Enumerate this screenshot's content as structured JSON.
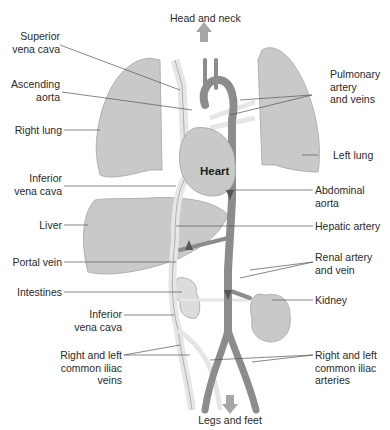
{
  "diagram": {
    "type": "circulatory-system-overview",
    "colors": {
      "organ_fill": "#c9c9c9",
      "organ_stroke": "#9a9a9a",
      "artery": "#8c8c8c",
      "vein": "#e6e6e6",
      "vein_stroke": "#b0b0b0",
      "leader_line": "#555555",
      "direction_arrow": "#a6a6a6"
    },
    "direction_labels": {
      "top": "Head and neck",
      "bottom": "Legs and feet"
    },
    "organ_labels": {
      "heart": "Heart"
    },
    "left_labels": [
      {
        "id": "superior-vena-cava",
        "text": "Superior\nvena cava"
      },
      {
        "id": "ascending-aorta",
        "text": "Ascending\naorta"
      },
      {
        "id": "right-lung",
        "text": "Right lung"
      },
      {
        "id": "inferior-vena-cava-upper",
        "text": "Inferior\nvena cava"
      },
      {
        "id": "liver",
        "text": "Liver"
      },
      {
        "id": "portal-vein",
        "text": "Portal vein"
      },
      {
        "id": "intestines",
        "text": "Intestines"
      },
      {
        "id": "inferior-vena-cava-lower",
        "text": "Inferior\nvena cava"
      },
      {
        "id": "common-iliac-veins",
        "text": "Right and left\ncommon iliac\nveins"
      }
    ],
    "right_labels": [
      {
        "id": "pulmonary-artery-veins",
        "text": "Pulmonary\nartery\nand veins"
      },
      {
        "id": "left-lung",
        "text": "Left lung"
      },
      {
        "id": "abdominal-aorta",
        "text": "Abdominal\naorta"
      },
      {
        "id": "hepatic-artery",
        "text": "Hepatic artery"
      },
      {
        "id": "renal-artery-vein",
        "text": "Renal artery\nand vein"
      },
      {
        "id": "kidney",
        "text": "Kidney"
      },
      {
        "id": "common-iliac-arteries",
        "text": "Right and left\ncommon iliac\narteries"
      }
    ]
  }
}
